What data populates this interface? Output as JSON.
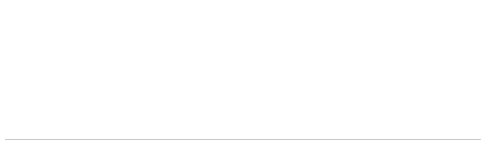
{
  "chart_data": {
    "type": "timeline",
    "title": "",
    "xlabel": "",
    "ylabel": "",
    "orientation": "horizontal",
    "grid": false,
    "legend": "none",
    "axis": {
      "tick_label_rotation": 0,
      "event_label_rotation": 45,
      "xlim": [
        1693,
        2012
      ]
    },
    "categories": [
      1693,
      1842,
      1908,
      1922,
      1977,
      1978,
      1988,
      2009,
      2012
    ],
    "values": [
      1693,
      1842,
      1908,
      1922,
      1977,
      1978,
      1988,
      2009,
      2012
    ],
    "events": [
      {
        "year": "1693",
        "lines": [
          "Massachusetts grants Nantucket",
          "sovereignty over its ponds"
        ],
        "x": 40
      },
      {
        "year": "1842",
        "lines": [
          "Muskeget vole discovered"
        ],
        "x": 78
      },
      {
        "year": "1908",
        "lines": [
          "Haulover cut closes"
        ],
        "x": 117
      },
      {
        "year": "1922",
        "lines": [
          "White-tailed deer reintroduced"
        ],
        "x": 156
      },
      {
        "year": "1977",
        "lines": [
          "First Nantucket case of",
          "Lyme disease diagnosed"
        ],
        "x": 195
      },
      {
        "year": "1978",
        "lines": [
          "Black rail found on Nantucket"
        ],
        "x": 234
      },
      {
        "year": "1988",
        "lines": [
          "Muskeget becomes gray seal",
          "breeding colony"
        ],
        "x": 276
      },
      {
        "year": "2009",
        "lines": [
          "Four-toed salamander found",
          "on Nantucket"
        ],
        "x": 318
      },
      {
        "year": "2012",
        "lines": [
          "Bigelow Point reaches ⅓ of the way",
          "to Muskeget Island from",
          "Tuckernuck"
        ],
        "x": 360
      }
    ],
    "colors": {
      "background": "#ffffff",
      "axis_line": "#c9c9c9",
      "tick": "#cfcfcf",
      "year_text": "#565656",
      "label_text": "#636363"
    }
  }
}
